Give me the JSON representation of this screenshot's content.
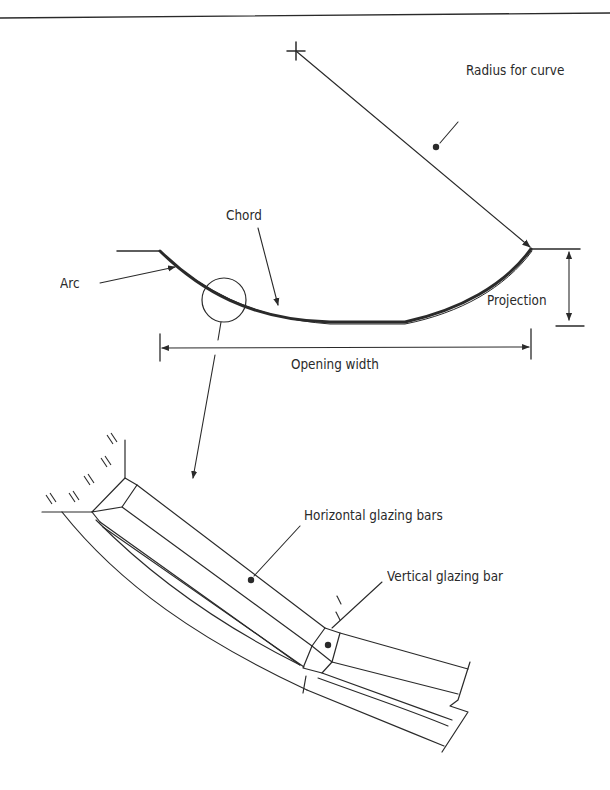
{
  "diagram": {
    "colors": {
      "ink": "#2a2a2a",
      "background": "#ffffff"
    },
    "top_view": {
      "labels": {
        "radius": "Radius for curve",
        "chord": "Chord",
        "arc": "Arc",
        "projection": "Projection",
        "opening_width": "Opening width"
      },
      "markers": [
        "center-cross",
        "detail-circle"
      ]
    },
    "detail_view": {
      "labels": {
        "horizontal_bars": "Horizontal glazing bars",
        "vertical_bar": "Vertical glazing bar"
      }
    }
  }
}
